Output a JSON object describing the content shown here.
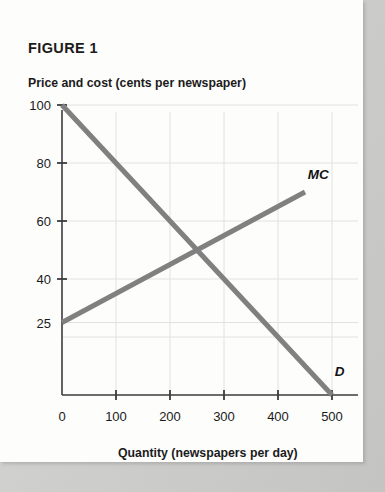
{
  "figure": {
    "title": "FIGURE 1"
  },
  "axes": {
    "y_title": "Price and cost (cents per newspaper)",
    "x_title": "Quantity (newspapers per day)"
  },
  "chart_data": {
    "type": "line",
    "title": "FIGURE 1",
    "xlabel": "Quantity (newspapers per day)",
    "ylabel": "Price and cost (cents per newspaper)",
    "xlim": [
      0,
      520
    ],
    "ylim": [
      0,
      105
    ],
    "grid": true,
    "legend": "inline-end-labels",
    "xticks": [
      0,
      100,
      200,
      300,
      400,
      500
    ],
    "xticklabels": [
      "0",
      "100",
      "200",
      "300",
      "400",
      "500"
    ],
    "yticks": [
      40,
      60,
      80,
      100
    ],
    "yticklabels": [
      "40",
      "60",
      "80",
      "100"
    ],
    "extra_ylabels": [
      {
        "value": 25,
        "text": "25",
        "tick": false
      }
    ],
    "series": [
      {
        "name": "D",
        "label": "D",
        "color": "#808080",
        "points": [
          {
            "x": 0,
            "y": 100
          },
          {
            "x": 500,
            "y": 0
          }
        ],
        "label_position": {
          "x": 505,
          "y": 8
        }
      },
      {
        "name": "MC",
        "label": "MC",
        "color": "#808080",
        "points": [
          {
            "x": 0,
            "y": 25
          },
          {
            "x": 450,
            "y": 70
          }
        ],
        "label_position": {
          "x": 455,
          "y": 76
        }
      }
    ],
    "annotations": [
      {
        "text": "intersection",
        "x": 250,
        "y": 50,
        "visible": false
      }
    ],
    "colors": {
      "curve": "#808080",
      "axis": "#3b3b3b",
      "grid": "#e2e2e2",
      "text": "#1b1b1b"
    }
  }
}
